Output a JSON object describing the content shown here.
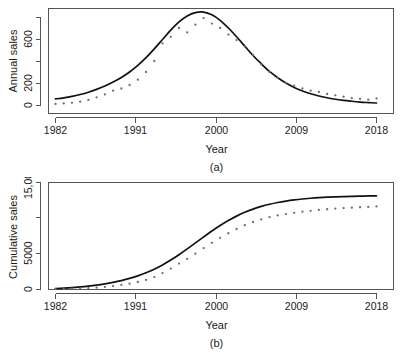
{
  "figure": {
    "panels": [
      {
        "id": "a",
        "caption": "(a)",
        "xlabel": "Year",
        "ylabel": "Annual sales"
      },
      {
        "id": "b",
        "caption": "(b)",
        "xlabel": "Year",
        "ylabel": "Cumulative sales"
      }
    ]
  },
  "chart_data": [
    {
      "type": "scatter",
      "id": "panel-a",
      "title": "",
      "caption": "(a)",
      "xlabel": "Year",
      "ylabel": "Annual sales",
      "xlim": [
        1982,
        2021
      ],
      "ylim": [
        0,
        860
      ],
      "xticks": [
        1982,
        1991,
        2000,
        2009,
        2018
      ],
      "xtick_labels": [
        "1982",
        "1991",
        "2000",
        "2009",
        "2018"
      ],
      "yticks": [
        0,
        200,
        400,
        600,
        800
      ],
      "ytick_labels": [
        "0",
        "200",
        "",
        "600",
        ""
      ],
      "grid": false,
      "legend": "none",
      "series": [
        {
          "name": "Observed annual sales",
          "marker": "point",
          "color": "#6e6e6e",
          "x": [
            1982,
            1983,
            1984,
            1985,
            1986,
            1987,
            1988,
            1989,
            1990,
            1991,
            1992,
            1993,
            1994,
            1995,
            1996,
            1997,
            1998,
            1999,
            2000,
            2001,
            2002,
            2003,
            2004,
            2005,
            2006,
            2007,
            2008,
            2009,
            2010,
            2011,
            2012,
            2013,
            2014,
            2015,
            2016,
            2017,
            2018,
            2019,
            2020,
            2021
          ],
          "values": [
            10,
            14,
            20,
            30,
            46,
            70,
            96,
            130,
            150,
            182,
            230,
            300,
            400,
            560,
            620,
            700,
            660,
            730,
            790,
            740,
            700,
            640,
            590,
            530,
            455,
            370,
            300,
            245,
            200,
            175,
            150,
            130,
            118,
            100,
            88,
            75,
            62,
            55,
            48,
            60
          ]
        },
        {
          "name": "Fitted Bass model curve",
          "marker": "line",
          "color": "#111111",
          "x": [
            1982,
            1983,
            1984,
            1985,
            1986,
            1987,
            1988,
            1989,
            1990,
            1991,
            1992,
            1993,
            1994,
            1995,
            1996,
            1997,
            1998,
            1999,
            2000,
            2001,
            2002,
            2003,
            2004,
            2005,
            2006,
            2007,
            2008,
            2009,
            2010,
            2011,
            2012,
            2013,
            2014,
            2015,
            2016,
            2017,
            2018,
            2019,
            2020,
            2021
          ],
          "values": [
            55,
            65,
            78,
            95,
            116,
            142,
            172,
            208,
            250,
            300,
            360,
            430,
            510,
            595,
            680,
            755,
            810,
            840,
            845,
            820,
            770,
            700,
            620,
            535,
            450,
            375,
            305,
            248,
            200,
            160,
            128,
            102,
            82,
            66,
            52,
            42,
            34,
            27,
            22,
            18
          ]
        }
      ]
    },
    {
      "type": "scatter",
      "id": "panel-b",
      "title": "",
      "caption": "(b)",
      "xlabel": "Year",
      "ylabel": "Cumulative sales",
      "xlim": [
        1982,
        2021
      ],
      "ylim": [
        0,
        16000
      ],
      "xticks": [
        1982,
        1991,
        2000,
        2009,
        2018
      ],
      "xtick_labels": [
        "1982",
        "1991",
        "2000",
        "2009",
        "2018"
      ],
      "yticks": [
        0,
        5000,
        10000,
        15000
      ],
      "ytick_labels": [
        "0",
        "5000",
        "",
        "15,000"
      ],
      "grid": false,
      "legend": "none",
      "series": [
        {
          "name": "Observed cumulative sales",
          "marker": "point",
          "color": "#6e6e6e",
          "x": [
            1982,
            1983,
            1984,
            1985,
            1986,
            1987,
            1988,
            1989,
            1990,
            1991,
            1992,
            1993,
            1994,
            1995,
            1996,
            1997,
            1998,
            1999,
            2000,
            2001,
            2002,
            2003,
            2004,
            2005,
            2006,
            2007,
            2008,
            2009,
            2010,
            2011,
            2012,
            2013,
            2014,
            2015,
            2016,
            2017,
            2018,
            2019,
            2020,
            2021
          ],
          "values": [
            10,
            24,
            44,
            74,
            120,
            190,
            286,
            416,
            566,
            748,
            978,
            1278,
            1678,
            2238,
            2858,
            3558,
            4218,
            4948,
            5738,
            6478,
            7178,
            7818,
            8408,
            8938,
            9393,
            9763,
            10063,
            10308,
            10508,
            10683,
            10833,
            10963,
            11081,
            11181,
            11269,
            11344,
            11406,
            11461,
            11509,
            11569
          ]
        },
        {
          "name": "Fitted cumulative Bass curve",
          "marker": "line",
          "color": "#111111",
          "x": [
            1982,
            1983,
            1984,
            1985,
            1986,
            1987,
            1988,
            1989,
            1990,
            1991,
            1992,
            1993,
            1994,
            1995,
            1996,
            1997,
            1998,
            1999,
            2000,
            2001,
            2002,
            2003,
            2004,
            2005,
            2006,
            2007,
            2008,
            2009,
            2010,
            2011,
            2012,
            2013,
            2014,
            2015,
            2016,
            2017,
            2018,
            2019,
            2020,
            2021
          ],
          "values": [
            55,
            120,
            198,
            293,
            409,
            551,
            723,
            931,
            1181,
            1481,
            1841,
            2271,
            2781,
            3376,
            4056,
            4811,
            5621,
            6461,
            7306,
            8126,
            8896,
            9596,
            10216,
            10751,
            11201,
            11576,
            11881,
            12129,
            12329,
            12489,
            12617,
            12719,
            12801,
            12867,
            12919,
            12961,
            12995,
            13022,
            13044,
            13062
          ]
        }
      ]
    }
  ]
}
